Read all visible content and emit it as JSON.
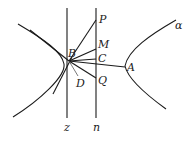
{
  "diagram": {
    "title": "",
    "labels": {
      "P": "P",
      "M": "M",
      "B": "B",
      "C": "C",
      "A": "A",
      "D": "D",
      "Q": "Q",
      "z": "z",
      "n": "n",
      "alpha": "α"
    },
    "colors": {
      "stroke": "#1a1a1a",
      "background": "#ffffff"
    }
  }
}
